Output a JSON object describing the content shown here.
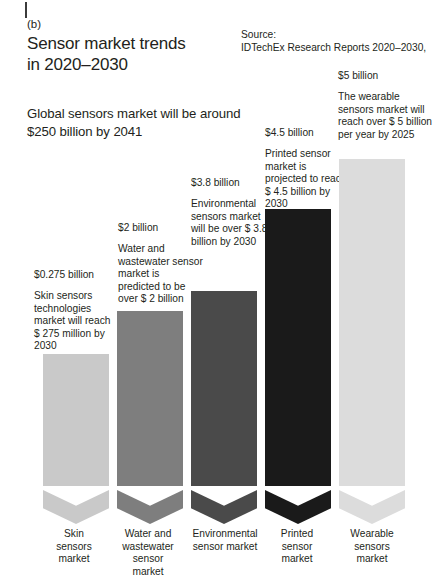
{
  "panel_letter": "(b)",
  "title": "Sensor market trends\nin 2020–2030",
  "subtitle": "Global sensors market will be around\n$250 billion by 2041",
  "source": "Source:\nIDTechEx Research Reports 2020–2030,",
  "chart_data": {
    "type": "bar",
    "title": "Sensor market trends in 2020–2030",
    "subtitle": "Global sensors market will be around $250 billion by 2041",
    "source": "Source: IDTechEx Research Reports 2020–2030,",
    "xlabel": "",
    "ylabel": "Market size (US$ billion)",
    "ylim": [
      0,
      5
    ],
    "grid": false,
    "legend": "none",
    "units": "US$ billion",
    "categories": [
      "Skin sensors market",
      "Water and wastewater sensor market",
      "Environmental sensor market",
      "Printed sensor market",
      "Wearable sensors market"
    ],
    "values": [
      0.275,
      2,
      3.8,
      4.5,
      5
    ],
    "value_labels": [
      "$0.275 billion",
      "$2 billion",
      "$3.8 billion",
      "$4.5 billion",
      "$5 billion"
    ],
    "colors": [
      "#c9c9c9",
      "#7e7e7e",
      "#4a4a4a",
      "#1a1a1a",
      "#dcdcdc"
    ],
    "annotations": [
      "Skin sensors technologies market will reach $ 275 million by 2030",
      "Water and wastewater sensor market is predicted to be over $ 2 billion",
      "Environmental sensors market will be over $ 3.8 billion by 2030",
      "Printed sensor market is projected to reach $ 4.5 billion by 2030",
      "The wearable sensors market will reach over $ 5 billion per year by 2025"
    ]
  },
  "bars": [
    {
      "amount": "$0.275 billion",
      "annotation": "Skin sensors technologies market will reach $ 275 million by 2030",
      "category": "Skin\nsensors\nmarket",
      "color": "#c9c9c9"
    },
    {
      "amount": "$2 billion",
      "annotation": "Water and wastewater sensor market is predicted to be over $ 2 billion",
      "category": "Water and\nwastewater\nsensor\nmarket",
      "color": "#7e7e7e"
    },
    {
      "amount": "$3.8 billion",
      "annotation": "Environmental sensors market will be over $ 3.8 billion by 2030",
      "category": "Environmental\nsensor market",
      "color": "#4a4a4a"
    },
    {
      "amount": "$4.5 billion",
      "annotation": "Printed sensor market is projected to reach $ 4.5 billion by 2030",
      "category": "Printed\nsensor\nmarket",
      "color": "#1a1a1a"
    },
    {
      "amount": "$5 billion",
      "annotation": "The wearable sensors market will reach over $ 5 billion per year by 2025",
      "category": "Wearable\nsensors\nmarket",
      "color": "#dcdcdc"
    }
  ]
}
